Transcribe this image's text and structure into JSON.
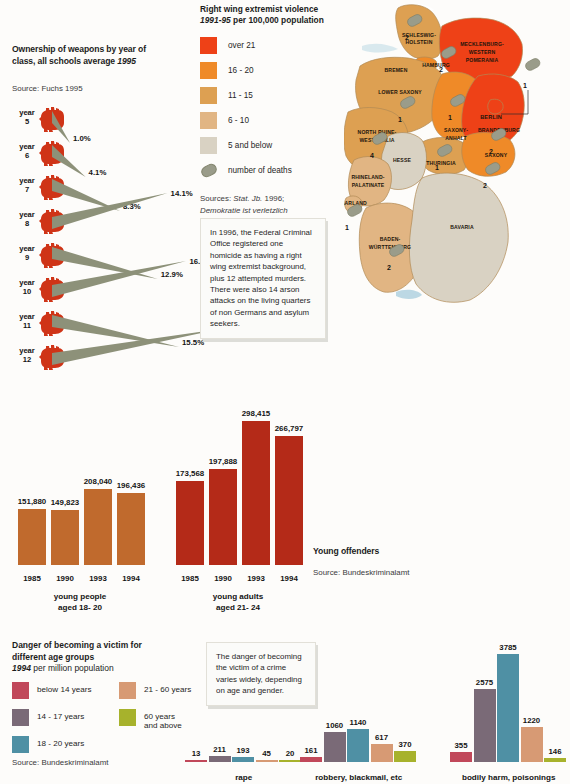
{
  "weapons": {
    "title_line1": "Ownership of weapons by year of",
    "title_line2": "class, all schools average ",
    "title_year": "1995",
    "source": "Source: Fuchs 1995",
    "year_word": "year",
    "rows": [
      {
        "label": "5",
        "value": "1.0%",
        "pct": 1.0
      },
      {
        "label": "6",
        "value": "4.1%",
        "pct": 4.1
      },
      {
        "label": "7",
        "value": "8.3%",
        "pct": 8.3
      },
      {
        "label": "8",
        "value": "14.1%",
        "pct": 14.1
      },
      {
        "label": "9",
        "value": "12.9%",
        "pct": 12.9
      },
      {
        "label": "10",
        "value": "16.4%",
        "pct": 16.4
      },
      {
        "label": "11",
        "value": "15.5%",
        "pct": 15.5
      },
      {
        "label": "12",
        "value": "20.5%",
        "pct": 20.5
      }
    ],
    "hand_color": "#cf3417",
    "wedge_color": "#8d9179"
  },
  "map_legend": {
    "title": "Right wing extremist violence",
    "years": "1991-95",
    "title_rest": " per 100,000 population",
    "items": [
      {
        "label": "over 21",
        "color": "#ee4117"
      },
      {
        "label": "16 - 20",
        "color": "#ef8a28"
      },
      {
        "label": "11 - 15",
        "color": "#dda052"
      },
      {
        "label": "6 - 10",
        "color": "#e1b583"
      },
      {
        "label": "5 and below",
        "color": "#d9d2c3"
      }
    ],
    "deaths_label": "number of deaths",
    "sources_line1_a": "Sources: ",
    "sources_line1_b": "Stat. Jb.",
    "sources_line1_c": " 1996;",
    "sources_line2": "Demokratie ist verletzlich"
  },
  "map": {
    "states": [
      {
        "name": "SCHLESWIG-",
        "name2": "HOLSTEIN",
        "deaths": "2"
      },
      {
        "name": "HAMBURG",
        "deaths": ""
      },
      {
        "name": "MECKLENBURG-",
        "name2": "WESTERN",
        "name3": "POMERANIA",
        "deaths": "2"
      },
      {
        "name": "BREMEN",
        "deaths": ""
      },
      {
        "name": "LOWER SAXONY",
        "deaths": "1"
      },
      {
        "name": "BERLIN",
        "deaths": "1"
      },
      {
        "name": "BRANDENBURG",
        "deaths": "2"
      },
      {
        "name": "SAXONY-",
        "name2": "ANHALT",
        "deaths": "1"
      },
      {
        "name": "NORTH RHINE-",
        "name2": "WESTPHALIA",
        "deaths": "4"
      },
      {
        "name": "SAXONY",
        "deaths": "2"
      },
      {
        "name": "THURINGIA",
        "deaths": "1"
      },
      {
        "name": "HESSE",
        "deaths": ""
      },
      {
        "name": "RHINELAND-",
        "name2": "PALATINATE",
        "deaths": ""
      },
      {
        "name": "SAARLAND",
        "deaths": "1"
      },
      {
        "name": "BADEN-",
        "name2": "WÜRTTEMBERG",
        "deaths": "2"
      },
      {
        "name": "BAVARIA",
        "deaths": ""
      }
    ]
  },
  "callout_map": {
    "text": "In 1996, the Federal Criminal Office registered one homicide as having a right wing extremist background, plus 12 attempted murders. There were also 14 arson attacks on the living quarters of non Germans and asylum seekers."
  },
  "callout_victim": {
    "text": "The danger of becoming the victim of a crime varies widely, depending on age and gender."
  },
  "young_offenders": {
    "title": "Young offenders",
    "source": "Source: Bundeskriminalamt"
  },
  "victim_legend": {
    "title_line1": "Danger of becoming a victim for",
    "title_line2": "different age groups",
    "year": "1994",
    "unit": " per million population",
    "source": "Source: Bundeskriminalamt",
    "items": [
      {
        "label": "below 14 years",
        "color": "#c1485a"
      },
      {
        "label": "14 - 17 years",
        "color": "#7a6a77"
      },
      {
        "label": "18 - 20 years",
        "color": "#4f90a4"
      },
      {
        "label": "21 - 60 years",
        "color": "#d79a74"
      },
      {
        "label": "60 years",
        "label2": "and above",
        "color": "#a7b22c"
      }
    ]
  },
  "chart_data": [
    {
      "type": "bar",
      "title": "young people aged 18- 20",
      "caption_line1": "young people",
      "caption_line2": "aged 18- 20",
      "categories": [
        "1985",
        "1990",
        "1993",
        "1994"
      ],
      "values": [
        151880,
        149823,
        208040,
        196436
      ],
      "labels": [
        "151,880",
        "149,823",
        "208,040",
        "196,436"
      ],
      "color": "#c06a2d",
      "ylim": [
        0,
        300000
      ]
    },
    {
      "type": "bar",
      "title": "young adults aged 21- 24",
      "caption_line1": "young adults",
      "caption_line2": "aged 21- 24",
      "categories": [
        "1985",
        "1990",
        "1993",
        "1994"
      ],
      "values": [
        173568,
        197888,
        298415,
        266797
      ],
      "labels": [
        "173,568",
        "197,888",
        "298,415",
        "266,797"
      ],
      "color": "#b42a18",
      "ylim": [
        0,
        300000
      ]
    },
    {
      "type": "bar",
      "title": "Danger of becoming a victim for different age groups",
      "subtitle": "1994 per million population",
      "ylabel": "per million population",
      "categories": [
        "rape",
        "robbery, blackmail, etc",
        "bodily harm, poisonings"
      ],
      "series": [
        {
          "name": "below 14 years",
          "color": "#c1485a",
          "values": [
            13,
            161,
            355
          ]
        },
        {
          "name": "14 - 17 years",
          "color": "#7a6a77",
          "values": [
            211,
            1060,
            2575
          ]
        },
        {
          "name": "18 - 20 years",
          "color": "#4f90a4",
          "values": [
            193,
            1140,
            3785
          ]
        },
        {
          "name": "21 - 60 years",
          "color": "#d79a74",
          "values": [
            45,
            617,
            1220
          ]
        },
        {
          "name": "60 years and above",
          "color": "#a7b22c",
          "values": [
            20,
            370,
            146
          ]
        }
      ],
      "ylim": [
        0,
        3785
      ]
    }
  ]
}
